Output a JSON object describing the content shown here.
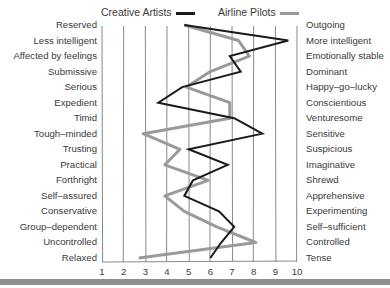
{
  "chart_data": {
    "type": "line",
    "title": "",
    "orientation": "horizontal-profile",
    "xlabel": "",
    "ylabel": "",
    "xlim": [
      1,
      10
    ],
    "x_ticks": [
      "1",
      "2",
      "3",
      "4",
      "5",
      "6",
      "7",
      "8",
      "9",
      "10"
    ],
    "grid": "vertical",
    "legend_position": "top",
    "left_labels": [
      "Reserved",
      "Less intelligent",
      "Affected by feelings",
      "Submissive",
      "Serious",
      "Expedient",
      "Timid",
      "Tough–minded",
      "Trusting",
      "Practical",
      "Forthright",
      "Self–assured",
      "Conservative",
      "Group–dependent",
      "Uncontrolled",
      "Relaxed"
    ],
    "right_labels": [
      "Outgoing",
      "More intelligent",
      "Emotionally stable",
      "Dominant",
      "Happy–go–lucky",
      "Conscientious",
      "Venturesome",
      "Sensitive",
      "Suspicious",
      "Imaginative",
      "Shrewd",
      "Apprehensive",
      "Experimenting",
      "Self–sufficient",
      "Controlled",
      "Tense"
    ],
    "series": [
      {
        "name": "Creative Artists",
        "color": "#1a1a1a",
        "values": [
          4.8,
          9.6,
          6.9,
          7.4,
          4.7,
          3.6,
          7.1,
          8.4,
          5.0,
          6.8,
          5.2,
          4.8,
          6.4,
          7.1,
          6.5,
          6.0
        ]
      },
      {
        "name": "Airline Pilots",
        "color": "#9a9a9a",
        "values": [
          4.8,
          7.3,
          7.8,
          6.0,
          4.9,
          6.9,
          6.9,
          2.9,
          4.6,
          3.9,
          5.9,
          3.9,
          4.8,
          6.3,
          8.1,
          2.7
        ]
      }
    ]
  },
  "legend": {
    "creative": "Creative Artists",
    "pilots": "Airline Pilots"
  }
}
